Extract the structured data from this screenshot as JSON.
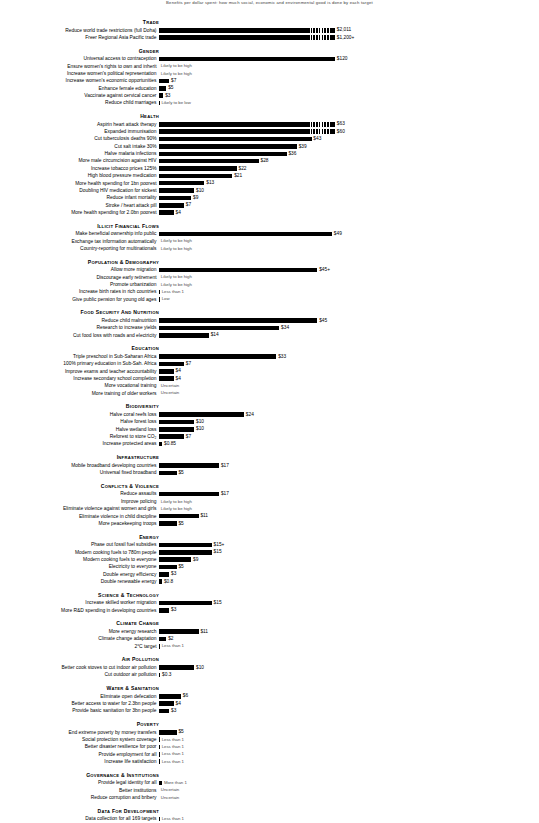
{
  "chart_data": {
    "type": "bar",
    "title": "Benefits per dollar spent: how much social, economic and environmental good is done by each target",
    "orientation": "horizontal",
    "xlabel": "",
    "ylabel": "",
    "value_prefix": "$",
    "axis_note": "Bars show benefit returned per dollar spent; top two bars use a broken scale",
    "bar_color": "#000000",
    "grid": false,
    "legend": false,
    "max_plot_value": 120,
    "sections": [
      {
        "heading": "Trade",
        "items": [
          {
            "label": "Reduce world trade restrictions (full Doha)",
            "value": 2011,
            "value_label": "$2,011",
            "display_width": 120,
            "broken_scale": true
          },
          {
            "label": "Freer Regional Asia Pacific trade",
            "value": 1200,
            "value_label": "$1,200+",
            "display_width": 120,
            "broken_scale": true
          }
        ]
      },
      {
        "heading": "Gender",
        "items": [
          {
            "label": "Universal access to contraception",
            "value": 120,
            "value_label": "$120",
            "display_width": 120
          },
          {
            "label": "Ensure women's rights to own and inherit",
            "value": null,
            "value_label": "Likely to be high",
            "display_width": 0,
            "qualitative": true
          },
          {
            "label": "Increase women's political representation",
            "value": null,
            "value_label": "Likely to be high",
            "display_width": 0,
            "qualitative": true
          },
          {
            "label": "Increase women's economic opportunities",
            "value": 7,
            "value_label": "$7",
            "display_width": 7
          },
          {
            "label": "Enhance female education",
            "value": 5,
            "value_label": "$5",
            "display_width": 5
          },
          {
            "label": "Vaccinate against cervical cancer",
            "value": 3,
            "value_label": "$3",
            "display_width": 3
          },
          {
            "label": "Reduce child marriages",
            "value": null,
            "value_label": "Likely to be low",
            "display_width": 0.4,
            "qualitative": true
          }
        ]
      },
      {
        "heading": "Health",
        "items": [
          {
            "label": "Aspirin heart attack therapy",
            "value": 63,
            "value_label": "$63",
            "display_width": 120,
            "broken_scale": true
          },
          {
            "label": "Expanded immunisation",
            "value": 60,
            "value_label": "$60",
            "display_width": 120,
            "broken_scale": true
          },
          {
            "label": "Cut tuberculosis deaths 90%",
            "value": 43,
            "value_label": "$43",
            "display_width": 104
          },
          {
            "label": "Cut salt intake 30%",
            "value": 39,
            "value_label": "$39",
            "display_width": 94
          },
          {
            "label": "Halve malaria infections",
            "value": 36,
            "value_label": "$36",
            "display_width": 87
          },
          {
            "label": "More male circumcision against HIV",
            "value": 28,
            "value_label": "$28",
            "display_width": 68
          },
          {
            "label": "Increase tobacco prices 125%",
            "value": 22,
            "value_label": "$22",
            "display_width": 53
          },
          {
            "label": "High blood pressure medication",
            "value": 21,
            "value_label": "$21",
            "display_width": 50
          },
          {
            "label": "More health spending for 1bn poorest",
            "value": 13,
            "value_label": "$13",
            "display_width": 31
          },
          {
            "label": "Doubling HIV medication for sickest",
            "value": 10,
            "value_label": "$10",
            "display_width": 24
          },
          {
            "label": "Reduce infant mortality",
            "value": 9,
            "value_label": "$9",
            "display_width": 22
          },
          {
            "label": "Stroke / heart attack pill",
            "value": 7,
            "value_label": "$7",
            "display_width": 17
          },
          {
            "label": "More health spending for 2.0bn poorest",
            "value": 4,
            "value_label": "$4",
            "display_width": 10
          }
        ]
      },
      {
        "heading": "Illicit Financial Flows",
        "items": [
          {
            "label": "Make beneficial ownership info public",
            "value": 49,
            "value_label": "$49",
            "display_width": 118
          },
          {
            "label": "Exchange tax information automatically",
            "value": null,
            "value_label": "Likely to be high",
            "display_width": 0,
            "qualitative": true
          },
          {
            "label": "Country-reporting for multinationals",
            "value": null,
            "value_label": "Likely to be high",
            "display_width": 0,
            "qualitative": true
          }
        ]
      },
      {
        "heading": "Population & Demography",
        "items": [
          {
            "label": "Allow more migration",
            "value": 45,
            "value_label": "$45+",
            "display_width": 108
          },
          {
            "label": "Discourage early retirement",
            "value": null,
            "value_label": "Likely to be high",
            "display_width": 0,
            "qualitative": true
          },
          {
            "label": "Promote urbanization",
            "value": null,
            "value_label": "Likely to be high",
            "display_width": 0,
            "qualitative": true
          },
          {
            "label": "Increase birth rates in rich countries",
            "value": null,
            "value_label": "Less than 1",
            "display_width": 0.6,
            "qualitative": true
          },
          {
            "label": "Give public pension for young old ages",
            "value": null,
            "value_label": "Low",
            "display_width": 0.6,
            "qualitative": true
          }
        ]
      },
      {
        "heading": "Food Security and Nutrition",
        "items": [
          {
            "label": "Reduce child malnutrition",
            "value": 45,
            "value_label": "$45",
            "display_width": 108
          },
          {
            "label": "Research to increase yields",
            "value": 34,
            "value_label": "$34",
            "display_width": 82
          },
          {
            "label": "Cut food loss with roads and electricity",
            "value": 14,
            "value_label": "$14",
            "display_width": 34
          }
        ]
      },
      {
        "heading": "Education",
        "items": [
          {
            "label": "Triple preschool in Sub-Saharan Africa",
            "value": 33,
            "value_label": "$33",
            "display_width": 80
          },
          {
            "label": "100% primary education in Sub-Sah. Africa",
            "value": 7,
            "value_label": "$7",
            "display_width": 17
          },
          {
            "label": "Improve exams and teacher accountability",
            "value": 4,
            "value_label": "$4",
            "display_width": 10
          },
          {
            "label": "Increase secondary school completion",
            "value": 4,
            "value_label": "$4",
            "display_width": 10
          },
          {
            "label": "More vocational training",
            "value": null,
            "value_label": "Uncertain",
            "display_width": 0,
            "qualitative": true
          },
          {
            "label": "More training of older workers",
            "value": null,
            "value_label": "Uncertain",
            "display_width": 0,
            "qualitative": true
          }
        ]
      },
      {
        "heading": "Biodiversity",
        "items": [
          {
            "label": "Halve coral reefs loss",
            "value": 24,
            "value_label": "$24",
            "display_width": 58
          },
          {
            "label": "Halve forest loss",
            "value": 10,
            "value_label": "$10",
            "display_width": 24
          },
          {
            "label": "Halve wetland loss",
            "value": 10,
            "value_label": "$10",
            "display_width": 24
          },
          {
            "label": "Reforest to store CO₂",
            "value": 7,
            "value_label": "$7",
            "display_width": 17
          },
          {
            "label": "Increase protected areas",
            "value": 0.85,
            "value_label": "$0.85",
            "display_width": 2.2
          }
        ]
      },
      {
        "heading": "Infrastructure",
        "items": [
          {
            "label": "Mobile broadband developing countries",
            "value": 17,
            "value_label": "$17",
            "display_width": 41
          },
          {
            "label": "Universal fixed broadband",
            "value": 5,
            "value_label": "$5",
            "display_width": 12
          }
        ]
      },
      {
        "heading": "Conflicts & Violence",
        "items": [
          {
            "label": "Reduce assaults",
            "value": 17,
            "value_label": "$17",
            "display_width": 41
          },
          {
            "label": "Improve policing",
            "value": null,
            "value_label": "Likely to be high",
            "display_width": 0,
            "qualitative": true
          },
          {
            "label": "Eliminate violence against women and girls",
            "value": null,
            "value_label": "Likely to be high",
            "display_width": 0,
            "qualitative": true
          },
          {
            "label": "Eliminate violence in child discipline",
            "value": 11,
            "value_label": "$11",
            "display_width": 27
          },
          {
            "label": "More peacekeeping troops",
            "value": 5,
            "value_label": "$5",
            "display_width": 12
          }
        ]
      },
      {
        "heading": "Energy",
        "items": [
          {
            "label": "Phase out fossil fuel subsidies",
            "value": 15,
            "value_label": "$15+",
            "display_width": 36
          },
          {
            "label": "Modern cooking fuels to 780m people",
            "value": 15,
            "value_label": "$15",
            "display_width": 36
          },
          {
            "label": "Modern cooking fuels to everyone",
            "value": 9,
            "value_label": "$9",
            "display_width": 22
          },
          {
            "label": "Electricity to everyone",
            "value": 5,
            "value_label": "$5",
            "display_width": 12
          },
          {
            "label": "Double energy efficiency",
            "value": 3,
            "value_label": "$3",
            "display_width": 7
          },
          {
            "label": "Double renewable energy",
            "value": 0.8,
            "value_label": "$0.8",
            "display_width": 2.1
          }
        ]
      },
      {
        "heading": "Science & Technology",
        "items": [
          {
            "label": "Increase skilled worker migration",
            "value": 15,
            "value_label": "$15",
            "display_width": 36
          },
          {
            "label": "More R&D spending in developing countries",
            "value": 3,
            "value_label": "$3",
            "display_width": 7
          }
        ]
      },
      {
        "heading": "Climate Change",
        "items": [
          {
            "label": "More energy research",
            "value": 11,
            "value_label": "$11",
            "display_width": 27
          },
          {
            "label": "Climate change adaptation",
            "value": 2,
            "value_label": "$2",
            "display_width": 5
          },
          {
            "label": "2°C target",
            "value": null,
            "value_label": "Less than 1",
            "display_width": 0.6,
            "qualitative": true
          }
        ]
      },
      {
        "heading": "Air Pollution",
        "items": [
          {
            "label": "Better cook stoves to cut indoor air pollution",
            "value": 10,
            "value_label": "$10",
            "display_width": 24
          },
          {
            "label": "Cut outdoor air pollution",
            "value": 0.3,
            "value_label": "$0.3",
            "display_width": 0.9
          }
        ]
      },
      {
        "heading": "Water & Sanitation",
        "items": [
          {
            "label": "Eliminate open defecation",
            "value": 6,
            "value_label": "$6",
            "display_width": 15
          },
          {
            "label": "Better access to water for 2.3bn people",
            "value": 4,
            "value_label": "$4",
            "display_width": 10
          },
          {
            "label": "Provide basic sanitation for 3bn people",
            "value": 3,
            "value_label": "$3",
            "display_width": 7
          }
        ]
      },
      {
        "heading": "Poverty",
        "items": [
          {
            "label": "End extreme poverty by money transfers",
            "value": 5,
            "value_label": "$5",
            "display_width": 12
          },
          {
            "label": "Social protection system coverage",
            "value": null,
            "value_label": "Less than 1",
            "display_width": 0.6,
            "qualitative": true
          },
          {
            "label": "Better disaster resilience for poor",
            "value": null,
            "value_label": "Less than 1",
            "display_width": 0.6,
            "qualitative": true
          },
          {
            "label": "Provide employment for all",
            "value": null,
            "value_label": "Less than 1",
            "display_width": 0.6,
            "qualitative": true
          },
          {
            "label": "Increase life satisfaction",
            "value": null,
            "value_label": "Less than 1",
            "display_width": 0.6,
            "qualitative": true
          }
        ]
      },
      {
        "heading": "Governance & Institutions",
        "items": [
          {
            "label": "Provide legal identity for all",
            "value": null,
            "value_label": "More than 1",
            "display_width": 2.1,
            "qualitative": true
          },
          {
            "label": "Better institutions",
            "value": null,
            "value_label": "Uncertain",
            "display_width": 0,
            "qualitative": true
          },
          {
            "label": "Reduce corruption and bribery",
            "value": null,
            "value_label": "Uncertain",
            "display_width": 0,
            "qualitative": true
          }
        ]
      },
      {
        "heading": "Data for Development",
        "items": [
          {
            "label": "Data collection for all 169 targets",
            "value": null,
            "value_label": "Less than 1",
            "display_width": 0.6,
            "qualitative": true
          }
        ]
      }
    ]
  }
}
